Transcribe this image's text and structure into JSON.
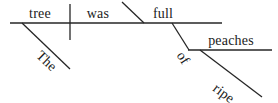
{
  "diagram": {
    "type": "reed-kellogg-sentence-diagram",
    "sentence": "The tree was full of ripe peaches.",
    "ink_color": "#222222",
    "background_color": "#ffffff",
    "words": {
      "subject": "tree",
      "verb": "was",
      "subject_modifier": "The",
      "complement": "full",
      "preposition": "of",
      "object_of_preposition": "peaches",
      "object_modifier": "ripe"
    },
    "labels": [
      {
        "id": "the",
        "text": "The",
        "role": "article-modifier"
      },
      {
        "id": "tree",
        "text": "tree",
        "role": "subject"
      },
      {
        "id": "was",
        "text": "was",
        "role": "linking-verb"
      },
      {
        "id": "full",
        "text": "full",
        "role": "predicate-adjective"
      },
      {
        "id": "of",
        "text": "of",
        "role": "preposition"
      },
      {
        "id": "peaches",
        "text": "peaches",
        "role": "object-of-preposition"
      },
      {
        "id": "ripe",
        "text": "ripe",
        "role": "adjective-modifier"
      }
    ]
  }
}
